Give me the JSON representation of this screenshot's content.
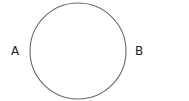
{
  "diagram": {
    "labels": {
      "left": "A",
      "right": "B"
    },
    "circle": {
      "cx": 78,
      "cy": 51,
      "r": 48,
      "stroke": "#6b6b6b",
      "fill": "#ffffff"
    }
  }
}
